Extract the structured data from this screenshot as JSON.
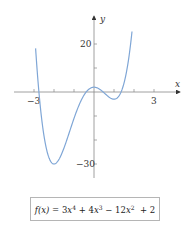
{
  "chart_data": {
    "type": "line",
    "title": "",
    "function": "f(x) = 3x^4 + 4x^3 - 12x^2 + 2",
    "xlabel": "x",
    "ylabel": "y",
    "x_ticks": [
      -3,
      -2,
      -1,
      1,
      2,
      3
    ],
    "x_tick_labels": [
      {
        "value": -3,
        "label": "−3"
      },
      {
        "value": 3,
        "label": "3"
      }
    ],
    "y_ticks": [
      -30,
      -20,
      -10,
      10,
      20
    ],
    "y_tick_labels": [
      {
        "value": 20,
        "label": "20"
      },
      {
        "value": -30,
        "label": "−30"
      }
    ],
    "xlim": [
      -3.0,
      3.7
    ],
    "ylim": [
      -37,
      34
    ],
    "grid": false,
    "series": [
      {
        "name": "f(x)",
        "color": "#7fa6d6",
        "x": [
          -2.9,
          -2.5,
          -2.0,
          -1.5,
          -1.0,
          -0.5,
          0,
          0.5,
          1.0,
          1.5,
          1.9
        ],
        "y": [
          27.3,
          -3.3,
          -30,
          -20.7,
          -11,
          -1.3,
          2,
          -0.3,
          -3,
          8.2,
          27.2
        ]
      }
    ],
    "key_points": [
      {
        "name": "local-min-left",
        "x": -2,
        "y": -30
      },
      {
        "name": "local-max",
        "x": 0,
        "y": 2
      },
      {
        "name": "local-min-right",
        "x": 1,
        "y": -3
      }
    ]
  },
  "labels": {
    "x_axis": "x",
    "y_axis": "y",
    "tick_x_neg3": "−3",
    "tick_x_3": "3",
    "tick_y_20": "20",
    "tick_y_neg30": "−30"
  },
  "formula": {
    "lhs": "f(x)",
    "eq": " = 3",
    "t1_var": "x",
    "t1_exp": "4",
    "t2": " + 4",
    "t2_var": "x",
    "t2_exp": "3",
    "t3": " − 12",
    "t3_var": "x",
    "t3_exp": "2",
    "t4": " + 2"
  },
  "colors": {
    "curve": "#7fa6d6",
    "axis": "#888888",
    "text": "#333333",
    "box_border": "#b5b5b5"
  }
}
